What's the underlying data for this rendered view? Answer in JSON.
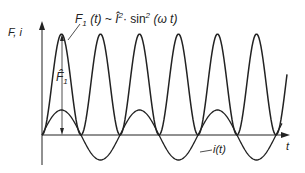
{
  "chart_data": {
    "type": "line",
    "title": "",
    "xlabel": "t",
    "ylabel": "F, i",
    "series": [
      {
        "name": "F1(t) ~ Î²·sin²(ωt)",
        "description": "force, double frequency, always >= 0",
        "amplitude_label": "F̂1",
        "periods_shown": 6.3
      },
      {
        "name": "i(t)",
        "description": "sinusoidal current",
        "periods_shown": 3.2
      }
    ],
    "grid": false
  },
  "labels": {
    "y_axis": "F, i",
    "x_axis": "t",
    "force_formula_prefix": "F",
    "force_formula_sub": "1",
    "force_formula_rest": " (t) ~ Î",
    "force_formula_tail": "· sin",
    "force_formula_arg": " (ω t)",
    "amplitude": "F̂",
    "amplitude_sub": "1",
    "current": "i(t)"
  }
}
